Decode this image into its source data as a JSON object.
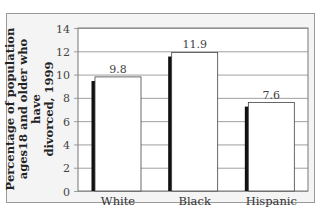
{
  "chart_data": {
    "type": "bar",
    "title": "",
    "xlabel": "",
    "ylabel": "Percentage of population ages18 and older who have divorced, 1999",
    "ylabel_lines": [
      "Percentage of population",
      "ages18 and older who have",
      "divorced, 1999"
    ],
    "categories": [
      "White",
      "Black",
      "Hispanic"
    ],
    "values": [
      9.8,
      11.9,
      7.6
    ],
    "value_labels": [
      "9.8",
      "11.9",
      "7.6"
    ],
    "ylim": [
      0,
      14
    ],
    "yticks": [
      0,
      2,
      4,
      6,
      8,
      10,
      12,
      14
    ],
    "grid": true,
    "legend": null
  },
  "colors": {
    "bar_fill": "#ffffff",
    "bar_shadow": "#111111",
    "frame_bg": "#f4f4f4",
    "grid": "#888888"
  }
}
